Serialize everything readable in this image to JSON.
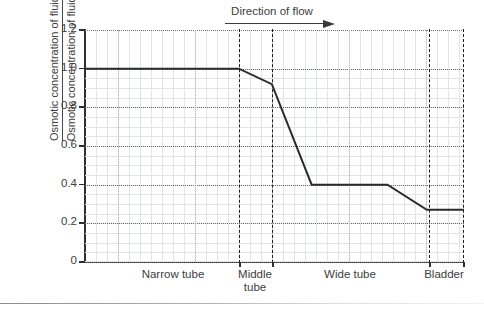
{
  "chart_data": {
    "type": "line",
    "title": "",
    "annotation": "Direction of flow",
    "annotation_icon": "arrow-right-icon",
    "ylabel_numerator": "Osmotic concentration of fluid in nephridium",
    "ylabel_denominator": "Osmotic concentration of fluid in body cavity",
    "xlabel": "",
    "ylim": [
      0,
      1.2
    ],
    "y_ticks": [
      "0",
      "0.2",
      "0.4",
      "0.6",
      "0.8",
      "1.0",
      "1.2"
    ],
    "y_tick_values": [
      0,
      0.2,
      0.4,
      0.6,
      0.8,
      1.0,
      1.2
    ],
    "grid": true,
    "grid_minor": true,
    "legend": "none",
    "x_categories": [
      "Narrow tube",
      "Middle\ntube",
      "Wide tube",
      "Bladder"
    ],
    "x_section_bounds": [
      0.0,
      0.406,
      0.493,
      0.908,
      1.0
    ],
    "series": [
      {
        "name": "Osmotic concentration ratio",
        "color": "#2b2b2b",
        "x": [
          0.0,
          0.406,
          0.493,
          0.598,
          0.798,
          0.902,
          1.0
        ],
        "values": [
          1.0,
          1.0,
          0.92,
          0.4,
          0.4,
          0.27,
          0.27
        ]
      }
    ]
  }
}
